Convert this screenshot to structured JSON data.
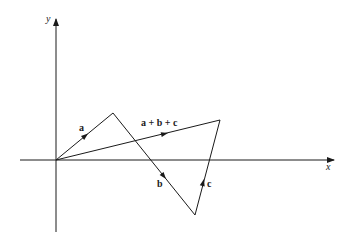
{
  "diagram": {
    "title": "",
    "axes": {
      "x_label": "x",
      "y_label": "y"
    },
    "vectors": [
      {
        "name": "a",
        "label": "a",
        "from": [
          56,
          160
        ],
        "to": [
          113,
          113
        ]
      },
      {
        "name": "b",
        "label": "b",
        "from": [
          113,
          113
        ],
        "to": [
          195,
          215
        ]
      },
      {
        "name": "c",
        "label": "c",
        "from": [
          195,
          215
        ],
        "to": [
          220,
          120
        ]
      },
      {
        "name": "sum",
        "label": "a + b + c",
        "from": [
          56,
          160
        ],
        "to": [
          220,
          120
        ]
      }
    ],
    "colors": {
      "line": "#1a1a1a",
      "background": "#ffffff"
    }
  }
}
